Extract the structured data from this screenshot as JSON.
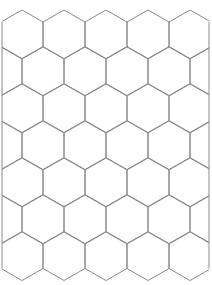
{
  "canvas": {
    "width": 212,
    "height": 285,
    "background": "#ffffff"
  },
  "grid": {
    "type": "hexagonal",
    "orientation": "pointy-top",
    "hex_width": 42,
    "hex_side": 24.5,
    "row_spacing": 37,
    "first_row_top": 10,
    "first_col_center": 22,
    "rows": 7,
    "cols": 5,
    "odd_row_offset": -21,
    "stroke_color": "#8a8a8a",
    "stroke_width": 1,
    "clip": {
      "left": 2,
      "right": 209,
      "top": 10,
      "bottom": 279
    }
  }
}
